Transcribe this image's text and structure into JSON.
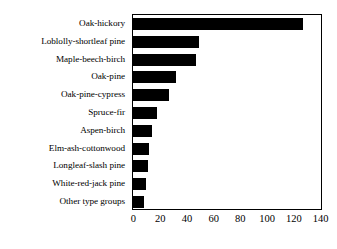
{
  "chart_data": {
    "type": "bar",
    "orientation": "horizontal",
    "title": "",
    "subtitle": "",
    "xlabel": "",
    "ylabel": "",
    "categories": [
      "Oak-hickory",
      "Loblolly-shortleaf pine",
      "Maple-beech-birch",
      "Oak-pine",
      "Oak-pine-cypress",
      "Spruce-fir",
      "Aspen-birch",
      "Elm-ash-cottonwood",
      "Longleaf-slash pine",
      "White-red-jack pine",
      "Other type groups"
    ],
    "values": [
      127,
      49,
      47,
      32,
      27,
      18,
      14,
      12,
      11,
      10,
      8
    ],
    "xlim": [
      0,
      140
    ],
    "xticks": [
      0,
      20,
      40,
      60,
      80,
      100,
      120,
      140
    ],
    "xtick_labels": [
      "0",
      "20",
      "40",
      "60",
      "80",
      "100",
      "120",
      "140"
    ],
    "grid": false,
    "legend": false,
    "bar_color": "#000000",
    "frame_color": "#000000",
    "background_color": "#ffffff"
  }
}
